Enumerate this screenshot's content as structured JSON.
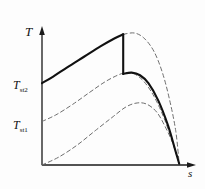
{
  "figure": {
    "kind": "thermodynamic-temperature-entropy-diagram",
    "background_color": "#fdfdfd",
    "axes": {
      "y_axis_label": "T",
      "x_axis_label": "s",
      "axis_color": "#1a1a1a",
      "origin_px": [
        42,
        165
      ],
      "y_top_px": 28,
      "x_right_px": 196
    },
    "tick_labels": [
      {
        "base": "T",
        "sub": "st2",
        "value_label": "T_st2"
      },
      {
        "base": "T",
        "sub": "st1",
        "value_label": "T_st1"
      }
    ],
    "curve_colors": {
      "solid": "#111111",
      "dashed": "#6e6e6e"
    }
  },
  "chart_data": {
    "type": "line",
    "title": "",
    "xlabel": "s",
    "ylabel": "T",
    "grid": false,
    "legend": null,
    "xlim": [
      0,
      1
    ],
    "ylim": [
      0,
      1
    ],
    "annotations": [
      {
        "text": "T_st2",
        "axis": "y",
        "value": 0.62
      },
      {
        "text": "T_st1",
        "axis": "y",
        "value": 0.33
      }
    ],
    "series": [
      {
        "name": "upper-solid-expansion",
        "style": "solid",
        "color": "#111111",
        "width": 2.1,
        "points": [
          [
            0.0,
            0.62
          ],
          [
            0.08,
            0.67
          ],
          [
            0.18,
            0.74
          ],
          [
            0.3,
            0.82
          ],
          [
            0.42,
            0.9
          ],
          [
            0.52,
            0.96
          ],
          [
            0.58,
            0.99
          ]
        ]
      },
      {
        "name": "vertical-drop",
        "style": "solid",
        "color": "#111111",
        "width": 2.1,
        "points": [
          [
            0.58,
            0.99
          ],
          [
            0.58,
            0.69
          ]
        ]
      },
      {
        "name": "lower-solid-expansion",
        "style": "solid",
        "color": "#111111",
        "width": 2.1,
        "points": [
          [
            0.58,
            0.69
          ],
          [
            0.64,
            0.7
          ],
          [
            0.7,
            0.68
          ],
          [
            0.76,
            0.62
          ],
          [
            0.83,
            0.49
          ],
          [
            0.9,
            0.3
          ],
          [
            0.955,
            0.1
          ],
          [
            0.98,
            0.01
          ]
        ]
      },
      {
        "name": "upper-dashed-saturation",
        "style": "dashed",
        "color": "#6e6e6e",
        "width": 1.0,
        "points": [
          [
            0.58,
            0.99
          ],
          [
            0.66,
            1.0
          ],
          [
            0.73,
            0.96
          ],
          [
            0.8,
            0.86
          ],
          [
            0.86,
            0.7
          ],
          [
            0.91,
            0.5
          ],
          [
            0.955,
            0.26
          ],
          [
            0.98,
            0.01
          ]
        ]
      },
      {
        "name": "middle-dashed-curve",
        "style": "dashed",
        "color": "#6e6e6e",
        "width": 1.0,
        "points": [
          [
            0.0,
            0.33
          ],
          [
            0.1,
            0.38
          ],
          [
            0.22,
            0.46
          ],
          [
            0.34,
            0.55
          ],
          [
            0.45,
            0.63
          ],
          [
            0.54,
            0.68
          ],
          [
            0.6,
            0.7
          ],
          [
            0.66,
            0.69
          ],
          [
            0.73,
            0.63
          ],
          [
            0.8,
            0.52
          ],
          [
            0.87,
            0.36
          ],
          [
            0.93,
            0.18
          ],
          [
            0.98,
            0.01
          ]
        ]
      },
      {
        "name": "lower-dashed-curve",
        "style": "dashed",
        "color": "#6e6e6e",
        "width": 1.0,
        "points": [
          [
            0.0,
            0.0
          ],
          [
            0.12,
            0.06
          ],
          [
            0.25,
            0.15
          ],
          [
            0.38,
            0.26
          ],
          [
            0.5,
            0.36
          ],
          [
            0.6,
            0.44
          ],
          [
            0.68,
            0.47
          ],
          [
            0.75,
            0.46
          ],
          [
            0.82,
            0.4
          ],
          [
            0.88,
            0.29
          ],
          [
            0.94,
            0.15
          ],
          [
            0.98,
            0.01
          ]
        ]
      }
    ]
  }
}
